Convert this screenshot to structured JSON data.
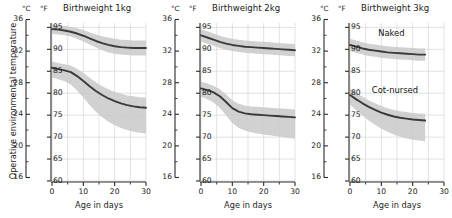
{
  "figure": {
    "ylabel": "Operative environmental temperature",
    "xlabel": "Age in days",
    "unit_c": "°C",
    "unit_f": "°F",
    "band_color": "#c9c9c9",
    "band_color_outer": "#dedede",
    "curve_color": "#3a3a3a",
    "grid_color": "#d6d6d6",
    "axis_color": "#2b2b2b"
  },
  "axes": {
    "y_c_ticks": [
      16,
      20,
      24,
      28,
      32,
      36
    ],
    "y_c_minor": [
      18,
      22,
      26,
      30,
      34
    ],
    "y_f_ticks": [
      60,
      65,
      70,
      75,
      80,
      85,
      90,
      95
    ],
    "x_ticks": [
      0,
      10,
      20,
      30
    ],
    "x_minor": [
      5,
      15,
      25
    ],
    "ylim_f": [
      60,
      96
    ],
    "xlim": [
      0,
      30
    ],
    "grid": true,
    "legend": "inline-annotations"
  },
  "chart_data": {
    "type": "line",
    "xlabel": "Age in days",
    "ylabel": "Operative environmental temperature",
    "x_unit": "days",
    "y_units": [
      "°C",
      "°F"
    ],
    "xlim": [
      0,
      30
    ],
    "ylim_f": [
      60,
      96
    ],
    "ylim_c": [
      15.6,
      35.6
    ],
    "grid": true,
    "panels": [
      {
        "title": "Birthweight 1kg",
        "series": [
          {
            "name": "Naked",
            "x": [
              0,
              2,
              4,
              6,
              8,
              10,
              12,
              14,
              16,
              18,
              20,
              22,
              24,
              26,
              28,
              30
            ],
            "y_f": [
              94.6,
              94.5,
              94.3,
              94.0,
              93.6,
              93.1,
              92.5,
              91.9,
              91.4,
              91.0,
              90.7,
              90.5,
              90.4,
              90.3,
              90.3,
              90.3
            ],
            "band_upper_f": [
              95.6,
              95.5,
              95.3,
              95.1,
              94.8,
              94.4,
              93.9,
              93.4,
              93.0,
              92.7,
              92.4,
              92.2,
              92.1,
              92.0,
              92.0,
              92.0
            ],
            "band_lower_f": [
              93.5,
              93.4,
              93.2,
              92.9,
              92.4,
              91.8,
              91.1,
              90.4,
              89.8,
              89.3,
              89.0,
              88.8,
              88.7,
              88.6,
              88.6,
              88.6
            ]
          },
          {
            "name": "Cot-nursed",
            "x": [
              0,
              2,
              4,
              6,
              8,
              10,
              12,
              14,
              16,
              18,
              20,
              22,
              24,
              26,
              28,
              30
            ],
            "y_f": [
              85.8,
              85.5,
              85.2,
              84.8,
              83.9,
              82.8,
              81.6,
              80.5,
              79.6,
              78.8,
              78.2,
              77.7,
              77.3,
              77.0,
              76.8,
              76.7
            ],
            "band_upper_f": [
              87.2,
              86.9,
              86.6,
              86.3,
              85.6,
              84.6,
              83.5,
              82.5,
              81.6,
              80.9,
              80.3,
              79.9,
              79.5,
              79.3,
              79.1,
              79.0
            ],
            "band_lower_f": [
              83.6,
              83.2,
              82.7,
              82.0,
              80.6,
              79.0,
              77.3,
              75.8,
              74.5,
              73.5,
              72.7,
              72.1,
              71.6,
              71.2,
              71.0,
              70.8
            ]
          }
        ]
      },
      {
        "title": "Birthweight 2kg",
        "series": [
          {
            "name": "Naked",
            "x": [
              0,
              2,
              4,
              6,
              8,
              10,
              12,
              14,
              16,
              18,
              20,
              22,
              24,
              26,
              28,
              30
            ],
            "y_f": [
              93.2,
              92.7,
              92.2,
              91.7,
              91.3,
              91.0,
              90.8,
              90.6,
              90.5,
              90.4,
              90.3,
              90.2,
              90.1,
              90.0,
              89.9,
              89.8
            ],
            "band_upper_f": [
              94.6,
              94.1,
              93.6,
              93.1,
              92.7,
              92.4,
              92.2,
              92.0,
              91.9,
              91.8,
              91.7,
              91.6,
              91.5,
              91.4,
              91.3,
              91.2
            ],
            "band_lower_f": [
              91.8,
              91.3,
              90.8,
              90.3,
              89.9,
              89.6,
              89.4,
              89.2,
              89.1,
              89.0,
              88.9,
              88.8,
              88.7,
              88.6,
              88.5,
              88.4
            ]
          },
          {
            "name": "Cot-nursed",
            "x": [
              0,
              2,
              4,
              6,
              8,
              10,
              12,
              14,
              16,
              18,
              20,
              22,
              24,
              26,
              28,
              30
            ],
            "y_f": [
              81.1,
              80.7,
              80.2,
              79.3,
              78.0,
              76.6,
              75.8,
              75.4,
              75.2,
              75.1,
              75.0,
              74.9,
              74.8,
              74.7,
              74.6,
              74.5
            ],
            "band_upper_f": [
              82.6,
              82.2,
              81.7,
              80.9,
              79.7,
              78.4,
              77.6,
              77.2,
              77.0,
              76.9,
              76.8,
              76.7,
              76.6,
              76.5,
              76.4,
              76.3
            ],
            "band_lower_f": [
              79.2,
              78.6,
              77.9,
              76.7,
              75.0,
              73.2,
              72.1,
              71.5,
              71.1,
              70.8,
              70.6,
              70.4,
              70.2,
              70.0,
              69.8,
              69.6
            ]
          }
        ]
      },
      {
        "title": "Birthweight 3kg",
        "series": [
          {
            "name": "Naked",
            "x": [
              0,
              2,
              4,
              6,
              8,
              10,
              12,
              14,
              16,
              18,
              20,
              22,
              24
            ],
            "y_f": [
              91.0,
              90.6,
              90.2,
              89.9,
              89.7,
              89.5,
              89.3,
              89.2,
              89.1,
              89.0,
              88.9,
              88.8,
              88.8
            ],
            "band_upper_f": [
              92.4,
              92.0,
              91.6,
              91.3,
              91.1,
              90.9,
              90.7,
              90.6,
              90.5,
              90.4,
              90.3,
              90.2,
              90.2
            ],
            "band_lower_f": [
              89.6,
              89.2,
              88.8,
              88.5,
              88.3,
              88.1,
              87.9,
              87.8,
              87.7,
              87.6,
              87.5,
              87.4,
              87.4
            ]
          },
          {
            "name": "Cot-nursed",
            "x": [
              0,
              2,
              4,
              6,
              8,
              10,
              12,
              14,
              16,
              18,
              20,
              22,
              24
            ],
            "y_f": [
              79.6,
              78.6,
              77.7,
              76.9,
              76.2,
              75.6,
              75.1,
              74.7,
              74.4,
              74.2,
              74.0,
              73.9,
              73.8
            ],
            "band_upper_f": [
              81.1,
              80.1,
              79.2,
              78.4,
              77.7,
              77.1,
              76.6,
              76.2,
              75.9,
              75.7,
              75.5,
              75.4,
              75.3
            ],
            "band_lower_f": [
              77.4,
              76.1,
              74.9,
              73.8,
              72.8,
              71.9,
              71.2,
              70.6,
              70.1,
              69.7,
              69.4,
              69.2,
              69.0
            ]
          }
        ]
      }
    ],
    "annotations": [
      {
        "text": "Naked",
        "panel": 2,
        "x": 16,
        "y_f": 93.5
      },
      {
        "text": "Cot-nursed",
        "panel": 2,
        "x": 14,
        "y_f": 80.5
      }
    ]
  }
}
